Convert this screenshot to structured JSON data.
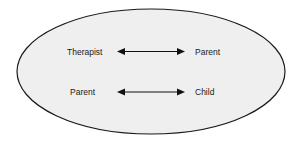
{
  "diagram": {
    "container": {
      "shape": "ellipse",
      "fill": "#efefef",
      "stroke": "#1a1a1a"
    },
    "relationships": [
      {
        "left": "Therapist",
        "right": "Parent",
        "connector": "bidirectional-arrow"
      },
      {
        "left": "Parent",
        "right": "Child",
        "connector": "bidirectional-arrow"
      }
    ]
  }
}
